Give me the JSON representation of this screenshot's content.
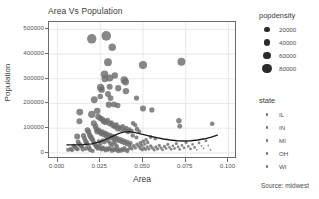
{
  "chart_data": {
    "type": "scatter",
    "title": "Area Vs Population",
    "xlabel": "Area",
    "ylabel": "Population",
    "caption": "Source: midwest",
    "grid": true,
    "xlim": [
      -0.005,
      0.105
    ],
    "ylim": [
      -25000,
      530000
    ],
    "xticks": [
      0.0,
      0.025,
      0.05,
      0.075,
      0.1
    ],
    "xtick_labels": [
      "0.000",
      "0.025",
      "0.050",
      "0.075",
      "0.100"
    ],
    "yticks": [
      0,
      100000,
      200000,
      300000,
      400000,
      500000
    ],
    "ytick_labels": [
      "0",
      "100000",
      "200000",
      "300000",
      "400000",
      "500000"
    ],
    "size_legend": {
      "title": "popdensity",
      "entries": [
        {
          "label": "20000",
          "value": 20000,
          "radius_px": 2.6
        },
        {
          "label": "40000",
          "value": 40000,
          "radius_px": 3.2
        },
        {
          "label": "60000",
          "value": 60000,
          "radius_px": 3.9
        },
        {
          "label": "80000",
          "value": 80000,
          "radius_px": 4.6
        }
      ]
    },
    "color_legend": {
      "title": "state",
      "entries": [
        {
          "label": "IL",
          "color": "#6e6e6e"
        },
        {
          "label": "IN",
          "color": "#6e6e6e"
        },
        {
          "label": "MI",
          "color": "#6e6e6e"
        },
        {
          "label": "OH",
          "color": "#6e6e6e"
        },
        {
          "label": "WI",
          "color": "#6e6e6e"
        }
      ]
    },
    "smooth_line": {
      "color": "#1a1a1a",
      "width_px": 1.3,
      "points": [
        [
          0.0055,
          32000
        ],
        [
          0.01,
          32500
        ],
        [
          0.015,
          33500
        ],
        [
          0.02,
          36000
        ],
        [
          0.0235,
          42000
        ],
        [
          0.027,
          51000
        ],
        [
          0.03,
          60000
        ],
        [
          0.033,
          70000
        ],
        [
          0.036,
          79000
        ],
        [
          0.039,
          85000
        ],
        [
          0.042,
          86000
        ],
        [
          0.045,
          83000
        ],
        [
          0.048,
          78000
        ],
        [
          0.051,
          73000
        ],
        [
          0.054,
          68000
        ],
        [
          0.058,
          62000
        ],
        [
          0.062,
          56000
        ],
        [
          0.066,
          52000
        ],
        [
          0.07,
          49000
        ],
        [
          0.074,
          48000
        ],
        [
          0.078,
          49000
        ],
        [
          0.082,
          52000
        ],
        [
          0.086,
          57000
        ],
        [
          0.09,
          64000
        ],
        [
          0.0935,
          72000
        ]
      ]
    },
    "points": [
      [
        0.02,
        462000,
        62000
      ],
      [
        0.0285,
        474000,
        66000
      ],
      [
        0.032,
        428000,
        36000
      ],
      [
        0.0295,
        367000,
        40000
      ],
      [
        0.05,
        356000,
        44000
      ],
      [
        0.0725,
        369000,
        42000
      ],
      [
        0.0275,
        318000,
        38000
      ],
      [
        0.0277,
        300000,
        30000
      ],
      [
        0.0305,
        303000,
        32000
      ],
      [
        0.039,
        295000,
        36000
      ],
      [
        0.0398,
        287000,
        30000
      ],
      [
        0.0335,
        313000,
        26000
      ],
      [
        0.0252,
        265000,
        34000
      ],
      [
        0.0258,
        256000,
        26000
      ],
      [
        0.0305,
        268000,
        22000
      ],
      [
        0.0355,
        262000,
        24000
      ],
      [
        0.04,
        250000,
        26000
      ],
      [
        0.0215,
        215000,
        30000
      ],
      [
        0.0295,
        238000,
        22000
      ],
      [
        0.031,
        222000,
        20000
      ],
      [
        0.025,
        228000,
        18000
      ],
      [
        0.0462,
        222000,
        16000
      ],
      [
        0.03,
        195000,
        24000
      ],
      [
        0.033,
        196000,
        20000
      ],
      [
        0.0352,
        192000,
        18000
      ],
      [
        0.05,
        180000,
        22000
      ],
      [
        0.0552,
        174000,
        16000
      ],
      [
        0.0232,
        170000,
        26000
      ],
      [
        0.013,
        165000,
        30000
      ],
      [
        0.02,
        156000,
        34000
      ],
      [
        0.0128,
        128000,
        22000
      ],
      [
        0.071,
        130000,
        18000
      ],
      [
        0.0715,
        108000,
        14000
      ],
      [
        0.0905,
        118000,
        12000
      ],
      [
        0.0115,
        66000,
        22000
      ],
      [
        0.0062,
        12000,
        10000
      ],
      [
        0.0238,
        146000,
        22000
      ],
      [
        0.025,
        140000,
        20000
      ],
      [
        0.0262,
        136000,
        18000
      ],
      [
        0.027,
        128000,
        22000
      ],
      [
        0.028,
        124000,
        20000
      ],
      [
        0.0292,
        132000,
        16000
      ],
      [
        0.0305,
        118000,
        18000
      ],
      [
        0.0315,
        122000,
        14000
      ],
      [
        0.0325,
        112000,
        20000
      ],
      [
        0.0335,
        106000,
        16000
      ],
      [
        0.0345,
        114000,
        14000
      ],
      [
        0.0352,
        98000,
        18000
      ],
      [
        0.0362,
        104000,
        12000
      ],
      [
        0.0372,
        96000,
        16000
      ],
      [
        0.0382,
        108000,
        12000
      ],
      [
        0.0392,
        92000,
        14000
      ],
      [
        0.0402,
        100000,
        12000
      ],
      [
        0.0412,
        86000,
        16000
      ],
      [
        0.042,
        94000,
        12000
      ],
      [
        0.0432,
        88000,
        14000
      ],
      [
        0.0442,
        120000,
        12000
      ],
      [
        0.0455,
        112000,
        10000
      ],
      [
        0.0465,
        96000,
        12000
      ],
      [
        0.0478,
        86000,
        10000
      ],
      [
        0.0212,
        120000,
        22000
      ],
      [
        0.0222,
        108000,
        20000
      ],
      [
        0.0228,
        96000,
        18000
      ],
      [
        0.0232,
        86000,
        20000
      ],
      [
        0.024,
        92000,
        16000
      ],
      [
        0.0248,
        84000,
        18000
      ],
      [
        0.0255,
        78000,
        16000
      ],
      [
        0.0262,
        86000,
        14000
      ],
      [
        0.027,
        74000,
        18000
      ],
      [
        0.0278,
        80000,
        14000
      ],
      [
        0.0285,
        68000,
        16000
      ],
      [
        0.0292,
        76000,
        12000
      ],
      [
        0.03,
        64000,
        16000
      ],
      [
        0.0308,
        72000,
        12000
      ],
      [
        0.0315,
        60000,
        14000
      ],
      [
        0.0322,
        68000,
        12000
      ],
      [
        0.033,
        56000,
        14000
      ],
      [
        0.0338,
        64000,
        10000
      ],
      [
        0.0345,
        52000,
        14000
      ],
      [
        0.0352,
        60000,
        10000
      ],
      [
        0.036,
        48000,
        12000
      ],
      [
        0.0368,
        56000,
        10000
      ],
      [
        0.0375,
        44000,
        12000
      ],
      [
        0.0382,
        52000,
        10000
      ],
      [
        0.039,
        40000,
        12000
      ],
      [
        0.0398,
        48000,
        10000
      ],
      [
        0.0405,
        36000,
        12000
      ],
      [
        0.0412,
        44000,
        9000
      ],
      [
        0.042,
        32000,
        11000
      ],
      [
        0.0428,
        40000,
        9000
      ],
      [
        0.0175,
        92000,
        20000
      ],
      [
        0.0182,
        84000,
        18000
      ],
      [
        0.0188,
        72000,
        16000
      ],
      [
        0.0195,
        64000,
        18000
      ],
      [
        0.0202,
        56000,
        16000
      ],
      [
        0.0208,
        48000,
        14000
      ],
      [
        0.0152,
        70000,
        16000
      ],
      [
        0.0158,
        58000,
        14000
      ],
      [
        0.0165,
        46000,
        16000
      ],
      [
        0.0172,
        38000,
        14000
      ],
      [
        0.012,
        44000,
        14000
      ],
      [
        0.0128,
        36000,
        12000
      ],
      [
        0.0135,
        30000,
        14000
      ],
      [
        0.0142,
        26000,
        12000
      ],
      [
        0.0095,
        28000,
        12000
      ],
      [
        0.0102,
        22000,
        10000
      ],
      [
        0.011,
        18000,
        12000
      ],
      [
        0.0118,
        14000,
        10000
      ],
      [
        0.0078,
        16000,
        10000
      ],
      [
        0.0085,
        10000,
        9000
      ],
      [
        0.0215,
        38000,
        14000
      ],
      [
        0.0222,
        30000,
        12000
      ],
      [
        0.0228,
        24000,
        14000
      ],
      [
        0.0235,
        18000,
        12000
      ],
      [
        0.0242,
        28000,
        11000
      ],
      [
        0.025,
        20000,
        12000
      ],
      [
        0.0258,
        14000,
        11000
      ],
      [
        0.0265,
        22000,
        10000
      ],
      [
        0.0272,
        16000,
        11000
      ],
      [
        0.028,
        10000,
        10000
      ],
      [
        0.0288,
        18000,
        10000
      ],
      [
        0.0295,
        12000,
        10000
      ],
      [
        0.0302,
        20000,
        9000
      ],
      [
        0.031,
        14000,
        9000
      ],
      [
        0.0318,
        8000,
        10000
      ],
      [
        0.0325,
        16000,
        9000
      ],
      [
        0.0332,
        10000,
        9000
      ],
      [
        0.034,
        18000,
        8000
      ],
      [
        0.0348,
        12000,
        9000
      ],
      [
        0.0355,
        6000,
        9000
      ],
      [
        0.0362,
        14000,
        8000
      ],
      [
        0.037,
        8000,
        9000
      ],
      [
        0.0378,
        16000,
        8000
      ],
      [
        0.0385,
        10000,
        8000
      ],
      [
        0.0392,
        20000,
        8000
      ],
      [
        0.04,
        12000,
        8000
      ],
      [
        0.0408,
        6000,
        8000
      ],
      [
        0.0415,
        14000,
        7000
      ],
      [
        0.0425,
        22000,
        8000
      ],
      [
        0.0435,
        16000,
        7000
      ],
      [
        0.0445,
        28000,
        8000
      ],
      [
        0.0455,
        20000,
        7000
      ],
      [
        0.0465,
        34000,
        8000
      ],
      [
        0.0475,
        26000,
        7000
      ],
      [
        0.0485,
        40000,
        9000
      ],
      [
        0.0492,
        30000,
        7000
      ],
      [
        0.05,
        46000,
        8000
      ],
      [
        0.051,
        36000,
        7000
      ],
      [
        0.0518,
        52000,
        8000
      ],
      [
        0.0528,
        42000,
        7000
      ],
      [
        0.0485,
        18000,
        7000
      ],
      [
        0.0495,
        12000,
        7000
      ],
      [
        0.0505,
        20000,
        6000
      ],
      [
        0.0515,
        14000,
        7000
      ],
      [
        0.0525,
        24000,
        6000
      ],
      [
        0.0535,
        16000,
        6000
      ],
      [
        0.0545,
        28000,
        7000
      ],
      [
        0.0555,
        20000,
        6000
      ],
      [
        0.0565,
        12000,
        6000
      ],
      [
        0.0575,
        24000,
        6000
      ],
      [
        0.0585,
        16000,
        6000
      ],
      [
        0.0595,
        30000,
        6000
      ],
      [
        0.0605,
        20000,
        6000
      ],
      [
        0.0615,
        12000,
        5000
      ],
      [
        0.0625,
        26000,
        6000
      ],
      [
        0.0635,
        18000,
        5000
      ],
      [
        0.0645,
        34000,
        6000
      ],
      [
        0.0655,
        22000,
        5000
      ],
      [
        0.0665,
        14000,
        5000
      ],
      [
        0.0675,
        28000,
        5000
      ],
      [
        0.0685,
        18000,
        5000
      ],
      [
        0.0695,
        38000,
        6000
      ],
      [
        0.0705,
        24000,
        5000
      ],
      [
        0.0715,
        14000,
        5000
      ],
      [
        0.0728,
        30000,
        5000
      ],
      [
        0.074,
        20000,
        5000
      ],
      [
        0.0752,
        42000,
        6000
      ],
      [
        0.0765,
        26000,
        5000
      ],
      [
        0.0778,
        16000,
        5000
      ],
      [
        0.079,
        34000,
        5000
      ],
      [
        0.0802,
        22000,
        5000
      ],
      [
        0.0815,
        12000,
        4000
      ],
      [
        0.0828,
        40000,
        5000
      ],
      [
        0.0842,
        28000,
        4000
      ],
      [
        0.0855,
        18000,
        4000
      ],
      [
        0.0868,
        48000,
        5000
      ],
      [
        0.0882,
        30000,
        4000
      ],
      [
        0.0895,
        12000,
        4000
      ],
      [
        0.0572,
        58000,
        8000
      ],
      [
        0.0545,
        64000,
        9000
      ],
      [
        0.0462,
        62000,
        10000
      ],
      [
        0.044,
        70000,
        11000
      ],
      [
        0.0185,
        22000,
        12000
      ],
      [
        0.019,
        12000,
        11000
      ],
      [
        0.0168,
        18000,
        12000
      ],
      [
        0.0148,
        14000,
        12000
      ],
      [
        0.0205,
        8000,
        11000
      ],
      [
        0.0242,
        46000,
        12000
      ],
      [
        0.0252,
        40000,
        11000
      ],
      [
        0.0265,
        50000,
        11000
      ],
      [
        0.0275,
        44000,
        11000
      ],
      [
        0.0288,
        54000,
        10000
      ],
      [
        0.0298,
        46000,
        10000
      ],
      [
        0.0308,
        38000,
        11000
      ],
      [
        0.0318,
        30000,
        10000
      ],
      [
        0.0328,
        42000,
        10000
      ],
      [
        0.0338,
        34000,
        10000
      ],
      [
        0.0348,
        26000,
        10000
      ]
    ]
  }
}
